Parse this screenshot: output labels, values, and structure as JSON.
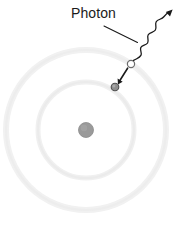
{
  "figure": {
    "background_color": "#ffffff",
    "width": 183,
    "height": 226,
    "label": {
      "text": "Photon",
      "x": 71,
      "y": 5,
      "font_size": 14,
      "color": "#1a1a1a"
    },
    "leader_line": {
      "name": "photon-leader-line",
      "from": [
        104,
        26
      ],
      "to": [
        137,
        42
      ],
      "color": "#1a1a1a",
      "stroke_width": 1.1
    },
    "nucleus": {
      "name": "nucleus",
      "cx": 86,
      "cy": 130,
      "r": 7.5,
      "fill": "#9a9a9a",
      "stroke": "#8a8a8a"
    },
    "orbits": [
      {
        "name": "inner-orbit",
        "cx": 86,
        "cy": 130,
        "rx": 48,
        "ry": 48,
        "stroke": "#f0f0f0",
        "stroke_width": 5
      },
      {
        "name": "outer-orbit",
        "cx": 86,
        "cy": 130,
        "rx": 80,
        "ry": 80,
        "stroke": "#f1f1f1",
        "stroke_width": 6
      }
    ],
    "electron": {
      "name": "electron",
      "cx": 115,
      "cy": 87,
      "r": 3.8,
      "fill": "#8f8f8f",
      "stroke": "#5a5a5a",
      "description": "filled gray dot on the inner orbit (final state)"
    },
    "vacancy": {
      "name": "electron-initial-position",
      "cx": 131,
      "cy": 64,
      "r": 3.6,
      "fill": "#ffffff",
      "stroke": "#6b6b6b",
      "description": "hollow circle on the outer orbit (initial state)"
    },
    "transition_arrow": {
      "name": "electron-transition-arrow",
      "from": [
        128,
        68
      ],
      "to": [
        118,
        83
      ],
      "color": "#1a1a1a",
      "stroke_width": 1.6,
      "description": "straight arrow from outer-orbit vacancy down to the electron"
    },
    "photon_wave": {
      "name": "photon-wave-arrow",
      "start": [
        133,
        60
      ],
      "end": [
        172,
        11
      ],
      "color": "#1a1a1a",
      "stroke_width": 1.3,
      "description": "wavy (sinusoidal) line from the transition point travelling up-right, ending in an arrowhead"
    }
  }
}
